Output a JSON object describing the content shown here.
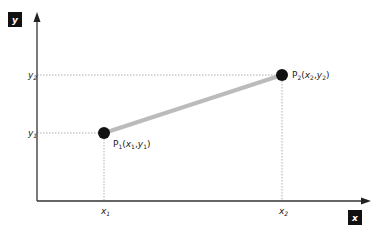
{
  "diagram": {
    "type": "coordinate-line-segment",
    "axes": {
      "x_label": "x",
      "y_label": "y"
    },
    "ticks": {
      "x1": {
        "base": "x",
        "sub": "1"
      },
      "x2": {
        "base": "x",
        "sub": "2"
      },
      "y1": {
        "base": "y",
        "sub": "1"
      },
      "y2": {
        "base": "y",
        "sub": "2"
      }
    },
    "points": [
      {
        "name": "P",
        "sub": "1",
        "x_base": "x",
        "x_sub": "1",
        "y_base": "y",
        "y_sub": "1"
      },
      {
        "name": "P",
        "sub": "2",
        "x_base": "x",
        "x_sub": "2",
        "y_base": "y",
        "y_sub": "2"
      }
    ],
    "colors": {
      "axis": "#333333",
      "segment": "#bbbbbb",
      "point": "#111111",
      "guide": "#999999"
    }
  }
}
